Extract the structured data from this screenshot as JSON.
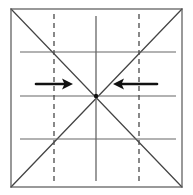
{
  "figure": {
    "title": "Origami crease-pattern square with two inward fold arrows",
    "type": "diagram",
    "width": 193,
    "height": 195,
    "background_color": "#ffffff"
  },
  "colors": {
    "border": "#555555",
    "solid_crease": "#666666",
    "dashed_crease": "#4a4a4a",
    "diagonal": "#444444",
    "arrow": "#111111"
  },
  "square": {
    "label": "paper-outline",
    "x": 11,
    "y": 9,
    "width": 171,
    "height": 178,
    "stroke_width": 1.2
  },
  "solid_horizontal_creases": [
    {
      "label": "upper-horizontal-crease",
      "x1": 20,
      "x2": 176,
      "y": 52
    },
    {
      "label": "middle-horizontal-crease",
      "x1": 20,
      "x2": 176,
      "y": 96
    },
    {
      "label": "lower-horizontal-crease",
      "x1": 20,
      "x2": 176,
      "y": 139
    }
  ],
  "solid_vertical_creases": [
    {
      "label": "center-vertical-crease",
      "x": 96,
      "y1": 16,
      "y2": 181
    }
  ],
  "dashed_vertical_creases": [
    {
      "label": "left-dashed-fold-line",
      "x": 54,
      "y1": 14,
      "y2": 183
    },
    {
      "label": "right-dashed-fold-line",
      "x": 139,
      "y1": 14,
      "y2": 183
    }
  ],
  "diagonals": [
    {
      "label": "diagonal-top-left-to-bottom-right",
      "x1": 11,
      "y1": 9,
      "x2": 182,
      "y2": 187
    },
    {
      "label": "diagonal-bottom-left-to-top-right",
      "x1": 11,
      "y1": 187,
      "x2": 182,
      "y2": 9
    }
  ],
  "arrows": [
    {
      "label": "left-fold-arrow",
      "direction": "right",
      "tail_x": 36,
      "head_x": 73,
      "y": 84,
      "stroke_width": 2.6
    },
    {
      "label": "right-fold-arrow",
      "direction": "left",
      "tail_x": 157,
      "head_x": 113,
      "y": 84,
      "stroke_width": 2.6
    }
  ],
  "center_point": {
    "label": "center-intersection",
    "x": 96,
    "y": 96,
    "radius": 2.2
  },
  "dash_pattern": "5,4"
}
